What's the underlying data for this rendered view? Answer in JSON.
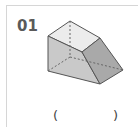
{
  "question": {
    "number": "01",
    "answer_open": "(",
    "answer_close": ")",
    "answer_value": ""
  },
  "figure": {
    "type": "3d-solid",
    "colors": {
      "top_face": "#ececec",
      "left_face": "#c9c9c9",
      "right_face": "#a9a9a9",
      "edge": "#555555",
      "hidden_edge": "#666666",
      "border": "#d6d6d6"
    }
  }
}
